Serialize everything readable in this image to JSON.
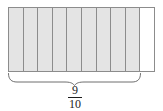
{
  "diagram": {
    "type": "fraction-strip-model",
    "total_parts": 10,
    "shaded_parts": 9,
    "fraction": {
      "numerator": "9",
      "denominator": "10"
    },
    "colors": {
      "shaded_fill": "#e4e4e4",
      "unshaded_fill": "#ffffff",
      "border": "#8c8c8c",
      "brace": "#6e6e6e",
      "text": "#1c1c1c"
    }
  }
}
